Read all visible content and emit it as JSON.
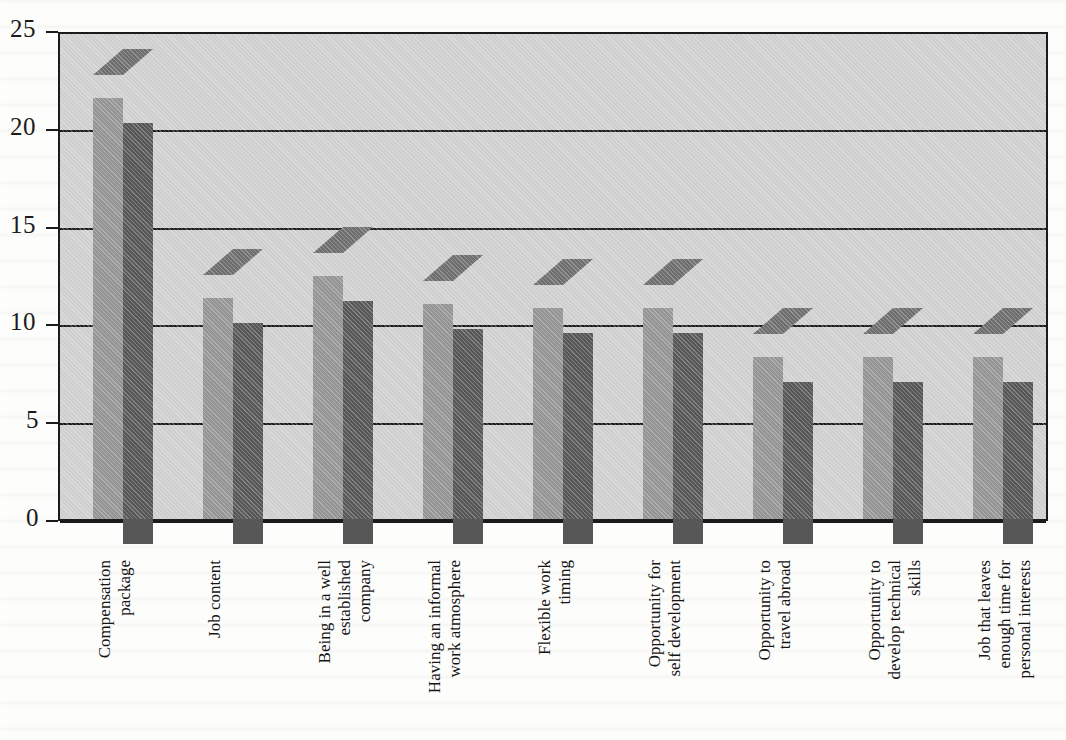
{
  "chart_data": {
    "type": "bar",
    "title": "",
    "subtitle": "",
    "xlabel": "",
    "ylabel": "",
    "ylim": [
      0,
      25
    ],
    "yticks": [
      0,
      5,
      10,
      15,
      20,
      25
    ],
    "ytick_labels": [
      "0",
      "5",
      "10",
      "15",
      "20",
      "25"
    ],
    "grid": true,
    "grid_axis": "y",
    "legend": false,
    "three_d": true,
    "categories": [
      "Compensation package",
      "Job content",
      "Being in a well established company",
      "Having an informal work atmosphere",
      "Flexible work timing",
      "Opportunity for self development",
      "Opportunity to travel abroad",
      "Opportunity to develop technical skills",
      "Job that leaves enough time for personal interests"
    ],
    "category_lines": [
      [
        "Compensation",
        "package"
      ],
      [
        "Job content"
      ],
      [
        "Being in a well",
        "established",
        "company"
      ],
      [
        "Having an informal",
        "work atmosphere"
      ],
      [
        "Flexible work",
        "timing"
      ],
      [
        "Opportunity for",
        "self development"
      ],
      [
        "Opportunity to",
        "travel abroad"
      ],
      [
        "Opportunity to",
        "develop technical",
        "skills"
      ],
      [
        "Job that leaves",
        "enough time for",
        "personal interests"
      ]
    ],
    "values": [
      21.5,
      11.3,
      12.4,
      11.0,
      10.8,
      10.8,
      8.3,
      8.3,
      8.3
    ],
    "colors": {
      "bar_front": "#575757",
      "bar_side": "#949494",
      "bar_top": "#6e6e6e",
      "plot_background": "#cfcfcf",
      "axis": "#1b1b1b",
      "page_background": "#fdfdfc",
      "text": "#141414"
    }
  }
}
